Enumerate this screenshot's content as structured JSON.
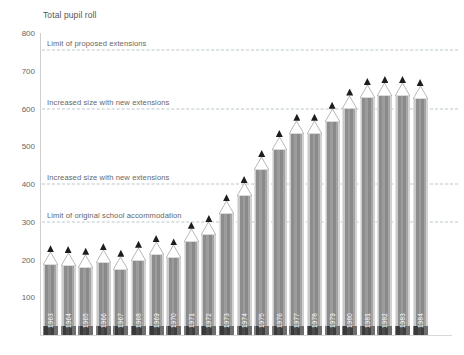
{
  "chart_data": {
    "type": "bar",
    "title": "Total pupil roll",
    "xlabel": "",
    "ylabel": "",
    "ylim": [
      0,
      800
    ],
    "yticks": [
      100,
      200,
      300,
      400,
      500,
      600,
      700,
      800
    ],
    "grid": false,
    "legend": "none",
    "bar_style": "pencil",
    "categories": [
      "1963",
      "1964",
      "1965",
      "1966",
      "1967",
      "1968",
      "1969",
      "1970",
      "1971",
      "1972",
      "1973",
      "1974",
      "1975",
      "1976",
      "1977",
      "1978",
      "1979",
      "1980",
      "1981",
      "1982",
      "1983",
      "1984"
    ],
    "values": [
      185,
      183,
      178,
      190,
      173,
      197,
      212,
      203,
      247,
      265,
      320,
      368,
      437,
      490,
      533,
      533,
      565,
      600,
      628,
      633,
      633,
      625
    ],
    "annotations": [
      {
        "label": "Limit of proposed extensions",
        "value": 755
      },
      {
        "label": "Increased size with new extensions",
        "value": 600
      },
      {
        "label": "Increased size with new extensions",
        "value": 400
      },
      {
        "label": "Limit of original school accommodation",
        "value": 300
      }
    ],
    "colors": {
      "barrel_dark": "#8d8d8d",
      "barrel_light": "#d2d2d2",
      "tip": "#1d1d1d",
      "cone": "#ffffff",
      "refline": "#b9c6cb",
      "axis": "#cfcfcf",
      "text": "#555555"
    }
  }
}
